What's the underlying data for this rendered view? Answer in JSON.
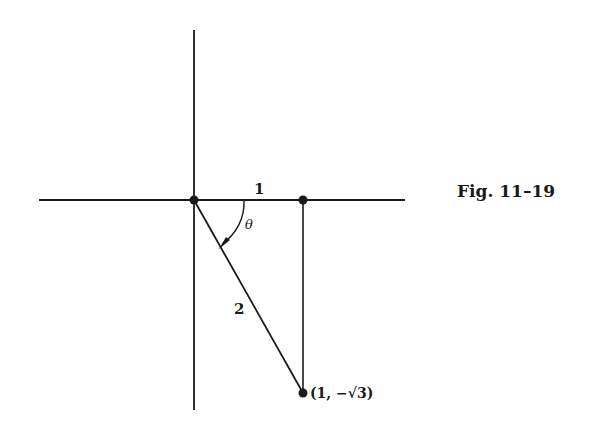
{
  "figure": {
    "caption": "Fig. 11–19",
    "labels": {
      "horizontal_side": "1",
      "hypotenuse": "2",
      "angle": "θ",
      "point": "(1, −√3)"
    },
    "colors": {
      "line": "#1a1a1a",
      "background": "#ffffff"
    },
    "points": [
      {
        "name": "origin",
        "coords": [
          0,
          0
        ]
      },
      {
        "name": "foot",
        "coords": [
          1,
          0
        ]
      },
      {
        "name": "terminal",
        "coords": [
          1,
          -1.732
        ]
      }
    ]
  }
}
